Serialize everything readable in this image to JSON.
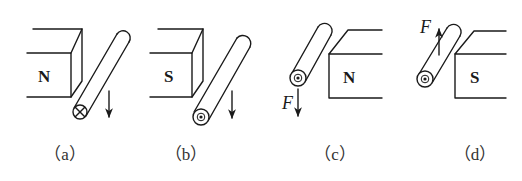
{
  "figure": {
    "panels": [
      {
        "id": "a",
        "caption": "（a）",
        "pole": "N",
        "current": "into-page",
        "current_symbol": "⊗",
        "arrow": "down",
        "force_label": ""
      },
      {
        "id": "b",
        "caption": "（b）",
        "pole": "S",
        "current": "out-of-page",
        "current_symbol": "⊙",
        "arrow": "down",
        "force_label": ""
      },
      {
        "id": "c",
        "caption": "（c）",
        "pole": "N",
        "current": "out-of-page",
        "current_symbol": "⊙",
        "arrow": "down",
        "force_label": "F"
      },
      {
        "id": "d",
        "caption": "（d）",
        "pole": "S",
        "current": "out-of-page",
        "current_symbol": "⊙",
        "arrow": "up",
        "force_label": "F"
      }
    ],
    "colors": {
      "line": "#1a1a1a",
      "background": "#ffffff",
      "caption": "#333333"
    }
  }
}
